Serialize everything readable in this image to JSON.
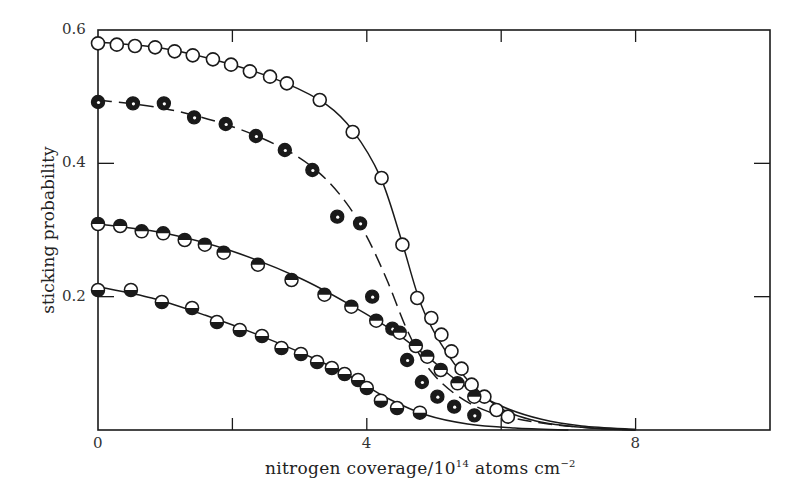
{
  "chart_data": {
    "type": "scatter",
    "title": "",
    "xlabel": "nitrogen coverage/10^14 atoms cm^-2",
    "xlabel_parts": {
      "main": "nitrogen coverage/10",
      "exp": "14",
      "units": " atoms cm",
      "units_exp": "−2"
    },
    "ylabel": "sticking probability",
    "xlim": [
      0,
      10
    ],
    "ylim": [
      0,
      0.6
    ],
    "grid": false,
    "legend": null,
    "x_ticks": [
      0,
      2,
      4,
      6,
      8
    ],
    "x_tick_labels": [
      {
        "value": 0,
        "label": "0"
      },
      {
        "value": 4,
        "label": "4"
      },
      {
        "value": 8,
        "label": "8"
      }
    ],
    "y_ticks": [
      0.2,
      0.4,
      0.6
    ],
    "y_tick_labels": [
      {
        "value": 0.6,
        "label": "0.6"
      },
      {
        "value": 0.4,
        "label": "0.4"
      },
      {
        "value": 0.2,
        "label": "0.2"
      }
    ],
    "series": [
      {
        "name": "open circles",
        "marker": "open-circle",
        "line": "solid",
        "points": [
          [
            0.0,
            0.58
          ],
          [
            0.28,
            0.578
          ],
          [
            0.55,
            0.576
          ],
          [
            0.85,
            0.574
          ],
          [
            1.14,
            0.568
          ],
          [
            1.41,
            0.562
          ],
          [
            1.71,
            0.556
          ],
          [
            1.98,
            0.548
          ],
          [
            2.26,
            0.538
          ],
          [
            2.56,
            0.53
          ],
          [
            2.81,
            0.52
          ],
          [
            3.3,
            0.495
          ],
          [
            3.79,
            0.447
          ],
          [
            4.22,
            0.378
          ],
          [
            4.53,
            0.278
          ],
          [
            4.75,
            0.198
          ],
          [
            4.96,
            0.168
          ],
          [
            5.11,
            0.143
          ],
          [
            5.26,
            0.118
          ],
          [
            5.41,
            0.092
          ],
          [
            5.56,
            0.068
          ],
          [
            5.75,
            0.05
          ],
          [
            5.93,
            0.03
          ],
          [
            6.1,
            0.02
          ]
        ],
        "curve": [
          [
            0.0,
            0.582
          ],
          [
            1.0,
            0.572
          ],
          [
            2.0,
            0.548
          ],
          [
            2.8,
            0.52
          ],
          [
            3.4,
            0.488
          ],
          [
            3.8,
            0.448
          ],
          [
            4.2,
            0.38
          ],
          [
            4.5,
            0.29
          ],
          [
            4.8,
            0.19
          ],
          [
            5.1,
            0.13
          ],
          [
            5.5,
            0.075
          ],
          [
            6.0,
            0.032
          ],
          [
            6.5,
            0.014
          ],
          [
            7.0,
            0.006
          ],
          [
            7.5,
            0.002
          ],
          [
            8.0,
            0.0
          ]
        ]
      },
      {
        "name": "filled circles",
        "marker": "filled-circle",
        "line": "dashed",
        "points": [
          [
            0.0,
            0.492
          ],
          [
            0.52,
            0.49
          ],
          [
            0.98,
            0.49
          ],
          [
            1.43,
            0.469
          ],
          [
            1.9,
            0.459
          ],
          [
            2.35,
            0.441
          ],
          [
            2.78,
            0.42
          ],
          [
            3.19,
            0.39
          ],
          [
            3.56,
            0.32
          ],
          [
            3.9,
            0.31
          ],
          [
            4.08,
            0.2
          ],
          [
            4.38,
            0.152
          ],
          [
            4.6,
            0.105
          ],
          [
            4.82,
            0.072
          ],
          [
            5.05,
            0.05
          ],
          [
            5.3,
            0.035
          ],
          [
            5.6,
            0.022
          ]
        ],
        "curve": [
          [
            0.0,
            0.495
          ],
          [
            1.0,
            0.482
          ],
          [
            2.0,
            0.455
          ],
          [
            2.8,
            0.42
          ],
          [
            3.3,
            0.385
          ],
          [
            3.7,
            0.34
          ],
          [
            4.0,
            0.29
          ],
          [
            4.3,
            0.225
          ],
          [
            4.6,
            0.15
          ],
          [
            4.9,
            0.095
          ],
          [
            5.3,
            0.055
          ],
          [
            5.8,
            0.028
          ],
          [
            6.5,
            0.012
          ],
          [
            7.2,
            0.004
          ],
          [
            8.0,
            0.0
          ]
        ]
      },
      {
        "name": "top-half filled circles",
        "marker": "top-half-circle",
        "line": "solid",
        "points": [
          [
            0.0,
            0.309
          ],
          [
            0.33,
            0.306
          ],
          [
            0.65,
            0.298
          ],
          [
            0.97,
            0.295
          ],
          [
            1.29,
            0.285
          ],
          [
            1.59,
            0.278
          ],
          [
            1.87,
            0.266
          ],
          [
            2.38,
            0.248
          ],
          [
            2.88,
            0.225
          ],
          [
            3.37,
            0.203
          ],
          [
            3.77,
            0.185
          ],
          [
            4.14,
            0.164
          ],
          [
            4.49,
            0.146
          ],
          [
            4.73,
            0.126
          ],
          [
            4.9,
            0.11
          ],
          [
            5.1,
            0.09
          ],
          [
            5.35,
            0.07
          ],
          [
            5.6,
            0.05
          ]
        ],
        "curve": [
          [
            0.0,
            0.309
          ],
          [
            1.0,
            0.295
          ],
          [
            2.0,
            0.268
          ],
          [
            3.0,
            0.228
          ],
          [
            3.8,
            0.185
          ],
          [
            4.4,
            0.148
          ],
          [
            4.9,
            0.11
          ],
          [
            5.4,
            0.07
          ],
          [
            6.0,
            0.036
          ],
          [
            6.6,
            0.016
          ],
          [
            7.2,
            0.006
          ],
          [
            8.0,
            0.001
          ]
        ]
      },
      {
        "name": "bottom-half filled circles",
        "marker": "bottom-half-circle",
        "line": "solid",
        "points": [
          [
            0.0,
            0.21
          ],
          [
            0.49,
            0.21
          ],
          [
            0.95,
            0.192
          ],
          [
            1.4,
            0.183
          ],
          [
            1.77,
            0.162
          ],
          [
            2.11,
            0.15
          ],
          [
            2.44,
            0.141
          ],
          [
            2.73,
            0.123
          ],
          [
            3.02,
            0.114
          ],
          [
            3.26,
            0.102
          ],
          [
            3.48,
            0.093
          ],
          [
            3.67,
            0.084
          ],
          [
            3.87,
            0.075
          ],
          [
            4.0,
            0.063
          ],
          [
            4.21,
            0.044
          ],
          [
            4.45,
            0.033
          ],
          [
            4.79,
            0.026
          ]
        ],
        "curve": [
          [
            0.0,
            0.215
          ],
          [
            0.8,
            0.198
          ],
          [
            1.6,
            0.172
          ],
          [
            2.4,
            0.142
          ],
          [
            3.2,
            0.108
          ],
          [
            3.8,
            0.078
          ],
          [
            4.3,
            0.048
          ],
          [
            4.9,
            0.022
          ],
          [
            5.5,
            0.009
          ],
          [
            6.2,
            0.003
          ],
          [
            7.0,
            0.0
          ]
        ]
      }
    ]
  },
  "plot_area": {
    "left": 98,
    "top": 30,
    "right": 770,
    "bottom": 430
  },
  "colors": {
    "ink": "#1a1a1a",
    "background": "#ffffff"
  }
}
